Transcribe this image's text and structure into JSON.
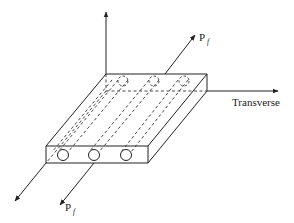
{
  "diagram": {
    "labels": {
      "load_top": {
        "main": "P",
        "sub": "f"
      },
      "load_bottom": {
        "main": "P",
        "sub": "f"
      },
      "transverse_axis": "Transverse"
    },
    "fibers_count": 3,
    "colors": {
      "stroke": "#222222",
      "background": "#ffffff"
    }
  }
}
